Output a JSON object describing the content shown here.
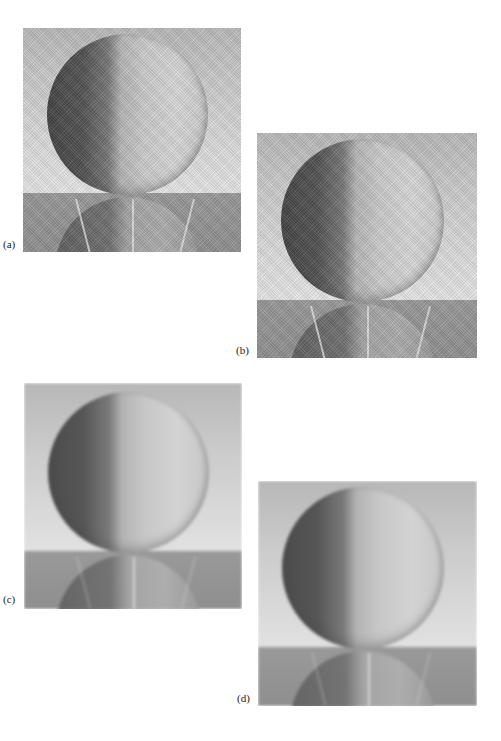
{
  "figure": {
    "panels": [
      {
        "id": "a",
        "label": "(a)",
        "x": 23,
        "y": 28,
        "w": 218,
        "h": 224,
        "horizon": 165,
        "style": "noisy",
        "label_x": 3,
        "label_y": 246
      },
      {
        "id": "b",
        "label": "(b)",
        "x": 257,
        "y": 133,
        "w": 220,
        "h": 225,
        "horizon": 167,
        "style": "noisy",
        "label_x": 236,
        "label_y": 352
      },
      {
        "id": "c",
        "label": "(c)",
        "x": 24,
        "y": 383,
        "w": 218,
        "h": 226,
        "horizon": 168,
        "style": "smooth",
        "label_x": 3,
        "label_y": 601
      },
      {
        "id": "d",
        "label": "(d)",
        "x": 258,
        "y": 481,
        "w": 219,
        "h": 225,
        "horizon": 166,
        "style": "smooth",
        "label_x": 237,
        "label_y": 700
      }
    ],
    "colors": {
      "background_top": "#b9b9b9",
      "background_bottom": "#e4e4e4",
      "floor": "#8f8f8f",
      "sphere_dark": "#4a4a4a",
      "sphere_light": "#d6d6d6",
      "label_text": "#222222"
    }
  }
}
